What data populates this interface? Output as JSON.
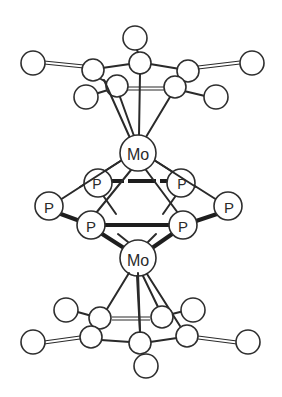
{
  "figure": {
    "type": "ball-and-stick molecular structure",
    "colors": {
      "line": "#2a2a2a",
      "atom_fill": "#ffffff"
    }
  },
  "labels": {
    "mo_top": "Mo",
    "mo_bottom": "Mo",
    "p_back_left": "P",
    "p_back_right": "P",
    "p_left": "P",
    "p_right": "P",
    "p_front_left": "P",
    "p_front_right": "P"
  },
  "atoms": {
    "mo_top": [
      138,
      153
    ],
    "mo_bottom": [
      138,
      258
    ]
  }
}
